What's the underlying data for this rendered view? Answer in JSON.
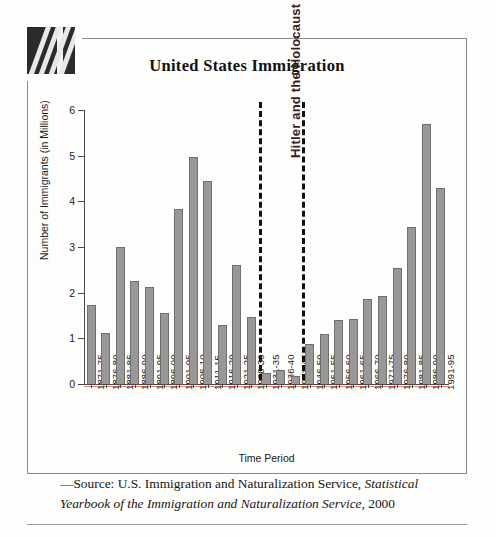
{
  "logo": {
    "name": "decorative-logo-block"
  },
  "chart_data": {
    "type": "bar",
    "title": "United States Immigration",
    "xlabel": "Time Period",
    "ylabel": "Number of Immigrants (in Millions)",
    "ylim": [
      0,
      6
    ],
    "yticks": [
      0,
      1,
      2,
      3,
      4,
      5,
      6
    ],
    "ytick_labels": [
      "0",
      "1",
      "2",
      "3",
      "4",
      "5",
      "6"
    ],
    "grid": false,
    "legend": null,
    "bar_color": "#989898",
    "bar_edge_color": "#6f6f6f",
    "categories": [
      "1871-75",
      "1876-80",
      "1881-85",
      "1886-90",
      "1891-95",
      "1896-00",
      "1901-05",
      "1906-10",
      "1911-15",
      "1916-20",
      "1921-25",
      "1926-30",
      "1931-35",
      "1936-40",
      "1941-45",
      "1946-50",
      "1951-55",
      "1956-60",
      "1961-65",
      "1966-70",
      "1971-75",
      "1976-80",
      "1981-85",
      "1986-90",
      "1991-95"
    ],
    "values": [
      1.72,
      1.11,
      3.0,
      2.26,
      2.12,
      1.56,
      3.83,
      4.97,
      4.45,
      1.3,
      2.6,
      1.47,
      0.24,
      0.31,
      0.17,
      0.88,
      1.1,
      1.4,
      1.43,
      1.86,
      1.92,
      2.54,
      3.44,
      5.7,
      4.3
    ],
    "annotations": [
      {
        "text": "Hitler and the Holocaust",
        "type": "vertical-span-label",
        "start_category": "1931-35",
        "end_category": "1941-45",
        "style": "dashed-vertical-lines",
        "color": "#3a1f1f"
      }
    ]
  },
  "source": {
    "prefix": "—Source: U.S. Immigration and Naturalization Service, ",
    "italic_part": "Statistical Yearbook of the Immigration and Naturalization Service",
    "suffix": ", 2000"
  }
}
